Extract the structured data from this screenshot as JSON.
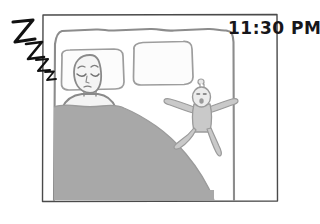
{
  "panel": {
    "type": "hand-drawn comic panel",
    "border_color": "#4a4a4a",
    "background_color": "#ffffff",
    "frame": {
      "x": 42,
      "y": 14,
      "width": 236,
      "height": 188
    }
  },
  "timestamp": {
    "label": "11:30 PM",
    "x": 228,
    "y": 34,
    "color": "#16161a"
  },
  "sleep_sound": {
    "label": "Z",
    "count": 4,
    "color": "#111111",
    "letters": [
      {
        "x": 12,
        "y": 22,
        "size": 22
      },
      {
        "x": 24,
        "y": 40,
        "size": 17
      },
      {
        "x": 35,
        "y": 55,
        "size": 13
      },
      {
        "x": 44,
        "y": 68,
        "size": 10
      }
    ]
  },
  "bed": {
    "name": "bed",
    "outline_color": "#8c8c8c",
    "blanket_color": "#a8a8a8",
    "blanket_edge_color": "#9a9a9a"
  },
  "pillows": [
    {
      "name": "pillow-left",
      "occupied": true
    },
    {
      "name": "pillow-right",
      "occupied": false
    }
  ],
  "figures": [
    {
      "name": "sleeping-adult",
      "state": "asleep",
      "eyes": "closed",
      "skin_color": "#f2f2f2",
      "outline_color": "#8a8a8a"
    },
    {
      "name": "awake-child",
      "state": "awake",
      "pose": "arms-outstretched",
      "hair": "topknot",
      "body_color": "#c9c9c9",
      "outline_color": "#9a9a9a"
    }
  ]
}
